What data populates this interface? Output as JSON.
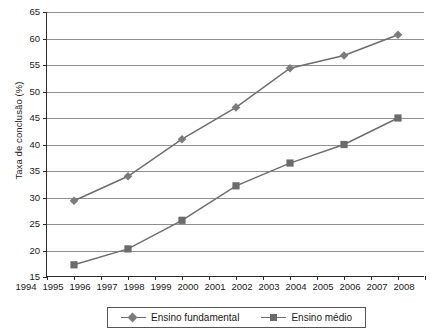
{
  "chart_data": {
    "type": "line",
    "title": "",
    "xlabel": "",
    "ylabel": "Taxa de conclusão (%)",
    "xlim": [
      1994,
      2008
    ],
    "ylim": [
      15,
      65
    ],
    "ytick_step": 5,
    "xtick_step": 1,
    "grid": true,
    "legend_position": "bottom",
    "x_ticks": [
      1994,
      1995,
      1996,
      1997,
      1998,
      1999,
      2000,
      2001,
      2002,
      2003,
      2004,
      2005,
      2006,
      2007,
      2008
    ],
    "y_ticks": [
      15,
      20,
      25,
      30,
      35,
      40,
      45,
      50,
      55,
      60,
      65
    ],
    "x": [
      1995,
      1997,
      1999,
      2001,
      2003,
      2005,
      2007
    ],
    "series": [
      {
        "name": "Ensino fundamental",
        "marker": "diamond",
        "color": "#7b7b7b",
        "values": [
          29.4,
          34.0,
          41.0,
          47.0,
          54.4,
          56.8,
          60.7
        ]
      },
      {
        "name": "Ensino médio",
        "marker": "square",
        "color": "#6b6b6b",
        "values": [
          17.3,
          20.3,
          25.7,
          32.2,
          36.5,
          40.0,
          45.0
        ]
      }
    ]
  },
  "legend": {
    "items": [
      {
        "label": "Ensino fundamental",
        "marker": "diamond-marker"
      },
      {
        "label": "Ensino médio",
        "marker": "square-marker"
      }
    ]
  },
  "colors": {
    "line": "#6e6e6e",
    "grid": "#8f8f8f",
    "axis": "#2b2b2b",
    "text": "#1a1a1a"
  }
}
